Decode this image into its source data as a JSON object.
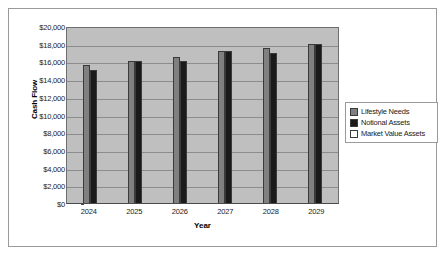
{
  "chart_data": {
    "type": "bar",
    "title": "",
    "xlabel": "Year",
    "ylabel": "Cash Flow",
    "categories": [
      "2024",
      "2025",
      "2026",
      "2027",
      "2028",
      "2029"
    ],
    "series": [
      {
        "name": "Lifestyle Needs",
        "color": "#808080",
        "values": [
          15600,
          16000,
          16500,
          17200,
          17500,
          18000
        ]
      },
      {
        "name": "Notional Assets",
        "color": "#1a1a1a",
        "values": [
          15000,
          16000,
          16000,
          17200,
          17000,
          18000
        ]
      },
      {
        "name": "Market Value Assets",
        "color": "#ffffff",
        "values": [
          0,
          0,
          0,
          0,
          0,
          0
        ]
      }
    ],
    "ylim": [
      0,
      20000
    ],
    "ytick_labels": [
      "$20,000",
      "$18,000",
      "$16,000",
      "$14,000",
      "$12,000",
      "$10,000",
      "$8,000",
      "$6,000",
      "$4,000",
      "$2,000",
      "$0"
    ],
    "ytick_values": [
      20000,
      18000,
      16000,
      14000,
      12000,
      10000,
      8000,
      6000,
      4000,
      2000,
      0
    ],
    "grid": true,
    "legend_position": "right",
    "plot_background": "#bfbfbf"
  }
}
